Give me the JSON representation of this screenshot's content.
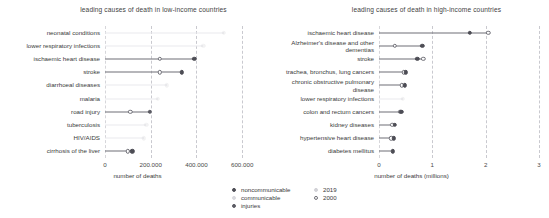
{
  "chart_data": [
    {
      "type": "scatter",
      "id": "low-income",
      "title": "leading causes of death in low-income countries",
      "xlabel": "number of deaths",
      "ylabel": "",
      "xlim": [
        0,
        700000
      ],
      "xticks": [
        0,
        200000,
        400000,
        600000
      ],
      "xticklabels": [
        "0",
        "200.000",
        "400.000",
        "600.000"
      ],
      "grid": true,
      "legend_position": "bottom-center",
      "categories": [
        "neonatal conditions",
        "lower respiratory infections",
        "ischaemic heart disease",
        "stroke",
        "diarrhoeal diseases",
        "malaria",
        "road injury",
        "tuberculosis",
        "HIV/AIDS",
        "cirrhosis of the liver"
      ],
      "series": [
        {
          "name": "2019",
          "values": [
            520000,
            430000,
            390000,
            335000,
            270000,
            230000,
            195000,
            180000,
            170000,
            120000
          ]
        },
        {
          "name": "2000",
          "values": [
            null,
            null,
            240000,
            240000,
            null,
            null,
            110000,
            null,
            null,
            100000
          ]
        }
      ],
      "cause_group": [
        "communicable",
        "communicable",
        "noncommunicable",
        "noncommunicable",
        "communicable",
        "communicable",
        "injuries",
        "communicable",
        "communicable",
        "noncommunicable"
      ],
      "rendered": [
        false,
        false,
        true,
        true,
        false,
        false,
        true,
        false,
        false,
        true
      ]
    },
    {
      "type": "scatter",
      "id": "high-income",
      "title": "leading causes of death in high-income countries",
      "xlabel": "number of deaths (millions)",
      "ylabel": "",
      "xlim": [
        0,
        3
      ],
      "xticks": [
        0,
        1,
        2,
        3
      ],
      "xticklabels": [
        "0",
        "1",
        "2",
        "3"
      ],
      "grid": true,
      "legend_position": "bottom-center",
      "categories": [
        "ischaemic heart disease",
        "Alzheimer's disease and other dementias",
        "stroke",
        "trachea, bronchus, lung cancers",
        "chronic obstructive pulmonary disease",
        "lower respiratory infections",
        "colon and rectum cancers",
        "kidney diseases",
        "hypertensive heart disease",
        "diabetes mellitus"
      ],
      "series": [
        {
          "name": "2019",
          "values": [
            1.7,
            0.81,
            0.72,
            0.5,
            0.48,
            0.45,
            0.42,
            0.3,
            0.28,
            0.26
          ]
        },
        {
          "name": "2000",
          "values": [
            2.05,
            0.3,
            0.83,
            0.46,
            0.43,
            null,
            0.4,
            0.25,
            0.23,
            null
          ]
        }
      ],
      "cause_group": [
        "noncommunicable",
        "noncommunicable",
        "noncommunicable",
        "noncommunicable",
        "noncommunicable",
        "communicable",
        "noncommunicable",
        "noncommunicable",
        "noncommunicable",
        "noncommunicable"
      ],
      "rendered": [
        true,
        true,
        true,
        true,
        true,
        false,
        true,
        true,
        true,
        true
      ]
    }
  ],
  "legend": {
    "cause_entries": [
      {
        "label": "noncommunicable",
        "swatch": "filled-dark-circle"
      },
      {
        "label": "communicable",
        "swatch": "filled-light-circle"
      },
      {
        "label": "injuries",
        "swatch": "filled-grey-circle"
      }
    ],
    "year_entries": [
      {
        "label": "2019",
        "swatch": "filled-circle"
      },
      {
        "label": "2000",
        "swatch": "open-circle"
      }
    ]
  },
  "colors": {
    "noncommunicable": "#4d4d55",
    "communicable": "#9a9aa2",
    "injuries": "#5c5c64",
    "connector": "#6e6e76",
    "gridline": "#c9c9cf",
    "text": "#3a3a3a",
    "background": "#ffffff"
  }
}
